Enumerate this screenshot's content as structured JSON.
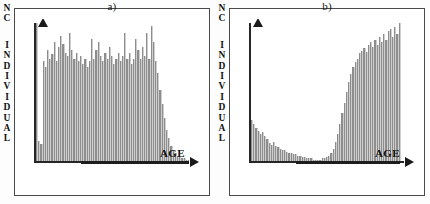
{
  "figure": {
    "background_color": "#ffffff",
    "bar_color": "#8d8d8d",
    "axis_color": "#262626",
    "border_color": "#4a4a4a"
  },
  "panels": [
    {
      "id": "a",
      "title": "a)",
      "ylabel_text": "N C INDIVIDUAL",
      "ylabel_chars": [
        "N",
        "C",
        "",
        "I",
        "N",
        "D",
        "I",
        "V",
        "I",
        "D",
        "U",
        "A",
        "L"
      ],
      "xlabel": "AGE"
    },
    {
      "id": "b",
      "title": "b)",
      "ylabel_text": "N C INDIVIDUAL",
      "ylabel_chars": [
        "N",
        "C",
        "",
        "I",
        "N",
        "D",
        "I",
        "V",
        "I",
        "D",
        "U",
        "A",
        "L"
      ],
      "xlabel": "AGE"
    }
  ],
  "chart_data": [
    {
      "type": "bar",
      "title": "a)",
      "xlabel": "AGE",
      "ylabel": "Nº INDIVIDUAL",
      "grid": false,
      "legend": "none",
      "ylim": [
        0,
        100
      ],
      "xlim": [
        0,
        70
      ],
      "description": "Broad plateau-shaped age histogram: near-uniform high frequencies across the younger and middle age classes, with a steep drop to near zero at the upper age classes.",
      "categories": [
        1,
        2,
        3,
        4,
        5,
        6,
        7,
        8,
        9,
        10,
        11,
        12,
        13,
        14,
        15,
        16,
        17,
        18,
        19,
        20,
        21,
        22,
        23,
        24,
        25,
        26,
        27,
        28,
        29,
        30,
        31,
        32,
        33,
        34,
        35,
        36,
        37,
        38,
        39,
        40,
        41,
        42,
        43,
        44,
        45,
        46,
        47,
        48,
        49,
        50,
        51,
        52,
        53,
        54,
        55,
        56,
        57,
        58,
        59,
        60,
        61,
        62,
        63,
        64,
        65,
        66,
        67,
        68,
        69,
        70
      ],
      "values": [
        97,
        14,
        12,
        70,
        66,
        78,
        72,
        75,
        84,
        70,
        80,
        88,
        82,
        76,
        74,
        90,
        78,
        72,
        76,
        70,
        74,
        68,
        72,
        66,
        70,
        86,
        72,
        78,
        84,
        74,
        70,
        76,
        72,
        80,
        74,
        68,
        72,
        76,
        70,
        74,
        90,
        72,
        76,
        68,
        72,
        86,
        78,
        72,
        80,
        74,
        90,
        72,
        95,
        84,
        70,
        62,
        50,
        40,
        30,
        22,
        16,
        11,
        8,
        6,
        4,
        3,
        2,
        2,
        1,
        1
      ]
    },
    {
      "type": "bar",
      "title": "b)",
      "xlabel": "AGE",
      "ylabel": "Nº INDIVIDUAL",
      "grid": false,
      "legend": "none",
      "ylim": [
        0,
        100
      ],
      "xlim": [
        0,
        70
      ],
      "description": "Strongly bimodal age histogram: a decaying left tail over the youngest classes, a long near-empty trough, then an abruptly rising tall block of high frequencies that is truncated at the upper end.",
      "categories": [
        1,
        2,
        3,
        4,
        5,
        6,
        7,
        8,
        9,
        10,
        11,
        12,
        13,
        14,
        15,
        16,
        17,
        18,
        19,
        20,
        21,
        22,
        23,
        24,
        25,
        26,
        27,
        28,
        29,
        30,
        31,
        32,
        33,
        34,
        35,
        36,
        37,
        38,
        39,
        40,
        41,
        42,
        43,
        44,
        45,
        46,
        47,
        48,
        49,
        50,
        51,
        52,
        53,
        54,
        55,
        56,
        57,
        58,
        59,
        60,
        61,
        62,
        63,
        64,
        65,
        66,
        67,
        68,
        69,
        70
      ],
      "values": [
        30,
        27,
        24,
        22,
        20,
        21,
        18,
        16,
        13,
        12,
        14,
        11,
        10,
        9,
        8,
        8,
        7,
        6,
        6,
        5,
        5,
        4,
        4,
        3,
        3,
        2,
        2,
        2,
        1,
        1,
        1,
        1,
        2,
        2,
        3,
        4,
        6,
        9,
        14,
        20,
        27,
        35,
        42,
        50,
        57,
        63,
        68,
        72,
        74,
        78,
        80,
        82,
        79,
        84,
        86,
        83,
        88,
        84,
        90,
        86,
        92,
        88,
        94,
        96,
        90,
        97,
        92,
        100,
        0,
        0
      ]
    }
  ]
}
